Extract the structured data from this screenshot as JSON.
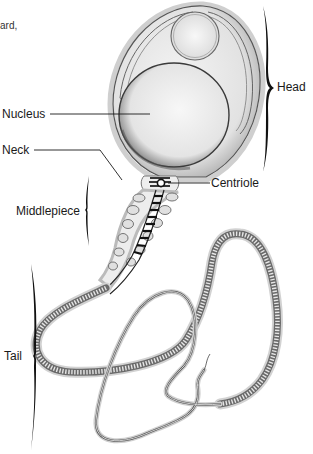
{
  "figure": {
    "caption_fragment": "ard,",
    "labels": {
      "nucleus": "Nucleus",
      "neck": "Neck",
      "middlepiece": "Middlepiece",
      "tail": "Tail",
      "head": "Head",
      "centriole": "Centriole"
    },
    "colors": {
      "ink": "#1a1a1a",
      "stipple": "#8a8a8a",
      "outline": "#555555",
      "halo": "#cfcfcf",
      "background": "#ffffff"
    }
  }
}
